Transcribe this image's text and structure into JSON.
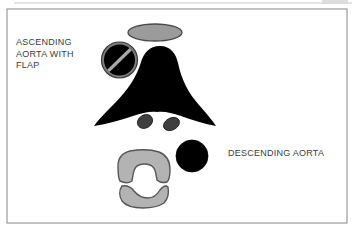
{
  "figure": {
    "background_color": "#ffffff",
    "frame": {
      "name": "figure-border",
      "x": 7,
      "y": 9,
      "width": 340,
      "height": 214,
      "stroke_color": "#9a9a9a",
      "stroke_width": 1.2,
      "fill": "none"
    },
    "scan_artifacts": [
      {
        "name": "top-scan-line",
        "x1": 14,
        "y1": 3,
        "x2": 352,
        "y2": 3,
        "color": "#c9c9c9"
      },
      {
        "name": "corner-smudge",
        "x": 322,
        "y": 0,
        "width": 26,
        "height": 5,
        "color": "#d8d8d8"
      }
    ]
  },
  "labels": {
    "ascending": {
      "id": "label-ascending",
      "lines": [
        "ASCENDING",
        "AORTA WITH",
        "FLAP"
      ],
      "text": "ASCENDING\nAORTA WITH\nFLAP",
      "color": "#3b3b3b",
      "font_size_px": 9
    },
    "descending": {
      "id": "label-descending",
      "lines": [
        "DESCENDING AORTA"
      ],
      "text": "DESCENDING AORTA",
      "color": "#3b3b3b",
      "font_size_px": 9
    }
  },
  "palette": {
    "black": "#000000",
    "dark_gray": "#404040",
    "mid_gray": "#9b9b9b",
    "light_gray": "#b3b3b3",
    "outline_gray": "#575757",
    "flap_gray": "#a8a8a8",
    "ring_gray": "#6f6f6f",
    "text_gray": "#3b3b3b",
    "frame_gray": "#9a9a9a",
    "white": "#ffffff"
  },
  "structures": [
    {
      "name": "sternum-ellipse",
      "description": "Sternum — horizontal gray ellipse anterior to the great vessels",
      "shape": "ellipse",
      "cx": 155,
      "cy": 32.5,
      "rx": 27,
      "ry": 8.5,
      "fill": "#9b9b9b",
      "stroke": "#4a4a4a",
      "stroke_width": 1.3
    },
    {
      "name": "ascending-aorta-with-flap",
      "description": "Ascending aorta: black lumen with gray wall ring and light gray intimal dissection flap",
      "shape": "circle-with-flap",
      "cx": 119.5,
      "cy": 60,
      "r_outer": 18,
      "r_inner": 15.5,
      "ring_fill": "#7d7d7d",
      "ring_stroke": "#3a3a3a",
      "lumen_fill": "#000000",
      "flap": {
        "name": "intimal-flap",
        "x1": 106,
        "y1": 73,
        "x2": 133,
        "y2": 47,
        "color": "#a8a8a8",
        "width": 3.4,
        "angle_deg": -44
      }
    },
    {
      "name": "mediastinum-silhouette",
      "description": "Large black mediastinal / cardiac silhouette, tent shaped with rounded apex and two sweeping inferolateral wings",
      "shape": "path",
      "fill": "#000000",
      "apex": {
        "x": 160,
        "y": 46
      },
      "left_tip": {
        "x": 94,
        "y": 126
      },
      "right_tip": {
        "x": 216,
        "y": 126
      },
      "notch": {
        "x": 157,
        "y": 112
      }
    },
    {
      "name": "paravertebral-nodule-left",
      "description": "Small dark gray oval nodule left of midline below the silhouette notch",
      "shape": "ellipse",
      "cx": 145,
      "cy": 121.5,
      "rx": 8,
      "ry": 6.5,
      "rotation_deg": -32,
      "fill": "#3f3f3f",
      "stroke": "#1a1a1a",
      "stroke_width": 0.8
    },
    {
      "name": "paravertebral-nodule-right",
      "description": "Small dark gray oval nodule right of midline below the silhouette notch",
      "shape": "ellipse",
      "cx": 171.5,
      "cy": 124,
      "rx": 8.5,
      "ry": 6,
      "rotation_deg": -28,
      "fill": "#3f3f3f",
      "stroke": "#1a1a1a",
      "stroke_width": 0.8
    },
    {
      "name": "descending-aorta",
      "description": "Descending aorta — solid black circle left of the vertebral body",
      "shape": "circle",
      "cx": 192,
      "cy": 156,
      "r": 16,
      "fill": "#000000",
      "stroke": "#000000",
      "stroke_width": 0.8
    },
    {
      "name": "vertebral-body",
      "description": "Vertebral body — gray horseshoe open inferiorly, with outline",
      "shape": "path",
      "bbox": {
        "x": 118,
        "y": 150,
        "width": 52,
        "height": 33
      },
      "fill": "#b3b3b3",
      "stroke": "#575757",
      "stroke_width": 1.4
    },
    {
      "name": "spinous-process",
      "description": "Posterior vertebral arch / spinous process — gray crescent concave superiorly",
      "shape": "path",
      "bbox": {
        "x": 120,
        "y": 185,
        "width": 48,
        "height": 23
      },
      "fill": "#b3b3b3",
      "stroke": "#575757",
      "stroke_width": 1.4
    }
  ]
}
